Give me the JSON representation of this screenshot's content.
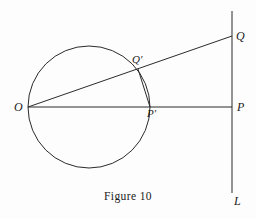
{
  "figure": {
    "caption": "Figure 10",
    "background_color": "#fdfdfd",
    "stroke_color": "#2b2b2b",
    "label_color": "#1a1a1a",
    "width": 256,
    "height": 219
  },
  "labels": {
    "O": "O",
    "Q": "Q",
    "Q_prime": "Q′",
    "P": "P",
    "P_prime": "P′",
    "L": "L"
  },
  "chart_data": {
    "type": "diagram",
    "title": "Figure 10",
    "subtitle": "",
    "xlabel": "",
    "ylabel": "",
    "coordinate_system": "pixels, origin top-left, y increases downward",
    "xlim": [
      0,
      256
    ],
    "ylim": [
      0,
      219
    ],
    "grid": false,
    "legend": null,
    "points": [
      {
        "name": "O",
        "label": "O",
        "x": 28,
        "y": 107,
        "label_x": 14,
        "label_y": 101
      },
      {
        "name": "Q",
        "label": "Q",
        "x": 232,
        "y": 36,
        "label_x": 236,
        "label_y": 30
      },
      {
        "name": "Qp",
        "label": "Q′",
        "x": 138,
        "y": 69,
        "label_x": 132,
        "label_y": 54
      },
      {
        "name": "P",
        "label": "P",
        "x": 232,
        "y": 107,
        "label_x": 237,
        "label_y": 101
      },
      {
        "name": "Pp",
        "label": "P′",
        "x": 150,
        "y": 107,
        "label_x": 147,
        "label_y": 108
      },
      {
        "name": "L",
        "label": "L",
        "x": 232,
        "y": 193,
        "label_x": 234,
        "label_y": 195
      }
    ],
    "shapes": [
      {
        "name": "circle-through-O",
        "type": "circle",
        "cx": 89,
        "cy": 107,
        "r": 61,
        "fill": "none",
        "stroke": "#2b2b2b",
        "stroke_width": 1
      },
      {
        "name": "line-L-vertical",
        "type": "line",
        "x1": 232,
        "y1": 11,
        "x2": 232,
        "y2": 193,
        "stroke": "#2b2b2b",
        "stroke_width": 1
      },
      {
        "name": "segment-O-to-P",
        "type": "line",
        "x1": 28,
        "y1": 107,
        "x2": 232,
        "y2": 107,
        "stroke": "#2b2b2b",
        "stroke_width": 1
      },
      {
        "name": "ray-O-to-Q",
        "type": "line",
        "x1": 28,
        "y1": 107,
        "x2": 232,
        "y2": 36,
        "stroke": "#2b2b2b",
        "stroke_width": 1
      },
      {
        "name": "chord-Qprime-to-Pprime",
        "type": "line",
        "x1": 138,
        "y1": 69,
        "x2": 150,
        "y2": 107,
        "stroke": "#2b2b2b",
        "stroke_width": 1
      }
    ]
  }
}
